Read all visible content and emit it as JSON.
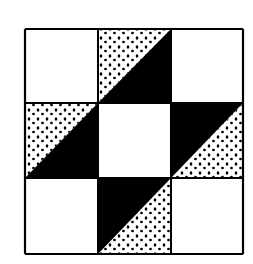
{
  "diagram": {
    "type": "nine-patch quilt block",
    "grid": {
      "rows": 3,
      "cols": 3
    },
    "colors": {
      "background": "#ffffff",
      "ink": "#000000",
      "dots": "#000000"
    },
    "bounds": {
      "x0": 25,
      "y0": 29,
      "x1": 243,
      "y1": 254
    },
    "lines": {
      "x": [
        25,
        98,
        171,
        243
      ],
      "y": [
        29,
        103,
        178,
        254
      ]
    },
    "cells": [
      {
        "row": 0,
        "col": 0,
        "fill": "blank"
      },
      {
        "row": 0,
        "col": 1,
        "fill": "half-square",
        "diagonal": "bottom-left-to-top-right",
        "upper_left": "dotted",
        "lower_right": "black"
      },
      {
        "row": 0,
        "col": 2,
        "fill": "blank"
      },
      {
        "row": 1,
        "col": 0,
        "fill": "half-square",
        "diagonal": "bottom-left-to-top-right",
        "upper_left": "dotted",
        "lower_right": "black"
      },
      {
        "row": 1,
        "col": 1,
        "fill": "blank"
      },
      {
        "row": 1,
        "col": 2,
        "fill": "half-square",
        "diagonal": "bottom-left-to-top-right",
        "upper_left": "black",
        "lower_right": "dotted"
      },
      {
        "row": 2,
        "col": 0,
        "fill": "blank"
      },
      {
        "row": 2,
        "col": 1,
        "fill": "half-square",
        "diagonal": "bottom-left-to-top-right",
        "upper_left": "black",
        "lower_right": "dotted"
      },
      {
        "row": 2,
        "col": 2,
        "fill": "blank"
      }
    ]
  }
}
